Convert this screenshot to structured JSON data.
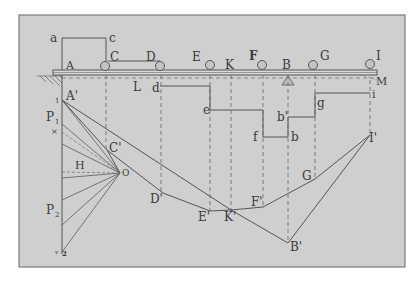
{
  "figure": {
    "background": "#cfcfcf",
    "ink": "#555555",
    "frame": {
      "x": 19,
      "y": 15,
      "w": 386,
      "h": 252
    }
  },
  "beam_labels": {
    "a": "a",
    "c": "c",
    "A": "A",
    "C": "C",
    "D": "D",
    "E": "E",
    "K": "K",
    "F": "F",
    "B": "B",
    "G": "G",
    "I": "I",
    "M": "M",
    "L": "L"
  },
  "load_line_labels": {
    "d": "d",
    "e": "e",
    "f": "f",
    "b_prime": "b'",
    "b": "b",
    "g": "g",
    "i": "i"
  },
  "force_polygon_labels": {
    "A_prime": "A'",
    "one": "1",
    "P1": "P",
    "P1_sub": "1",
    "x": "×",
    "H": "H",
    "O": "O",
    "P2": "P",
    "P2_sub": "2",
    "v": "v",
    "two": "2"
  },
  "funicular_labels": {
    "C_prime": "C'",
    "D_prime": "D'",
    "E_prime": "E'",
    "K_prime": "K'",
    "F_prime": "F'",
    "G_prime": "G",
    "I_prime": "I'",
    "B_prime": "B'"
  }
}
